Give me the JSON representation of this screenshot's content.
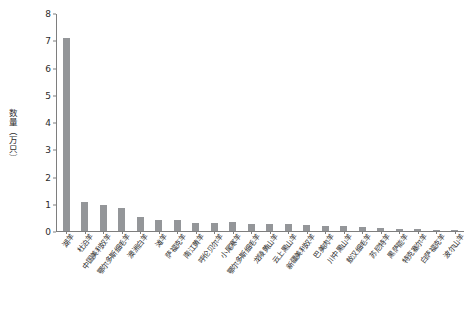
{
  "chart_data": {
    "type": "bar",
    "title": "",
    "xlabel": "",
    "ylabel": "数量（万只）",
    "ylim": [
      0,
      8
    ],
    "yticks": [
      0,
      1,
      2,
      3,
      4,
      5,
      6,
      7,
      8
    ],
    "grid": false,
    "legend": null,
    "bar_color": "#949699",
    "axis_color": "#7e7e7e",
    "categories": [
      "湖羊",
      "杜泊羊",
      "中国美利奴羊",
      "鄂尔多斯细毛羊",
      "澳洲白羊",
      "滩羊",
      "萨福克羊",
      "南江黄羊",
      "呼伦贝尔羊",
      "小尾寒羊",
      "鄂尔多斯细毛羊",
      "龙陵黄山羊",
      "云上黑山羊",
      "新疆美利奴羊",
      "巴美肉羊",
      "川中黑山羊",
      "敖汉细毛羊",
      "苏尼特羊",
      "黑萨能羊",
      "特克塞尔羊",
      "白萨福克羊",
      "波尔山羊"
    ],
    "values": [
      7.1,
      1.08,
      0.97,
      0.85,
      0.52,
      0.42,
      0.41,
      0.31,
      0.28,
      0.33,
      0.26,
      0.24,
      0.26,
      0.22,
      0.2,
      0.19,
      0.13,
      0.1,
      0.09,
      0.07,
      0.05,
      0.04
    ]
  }
}
